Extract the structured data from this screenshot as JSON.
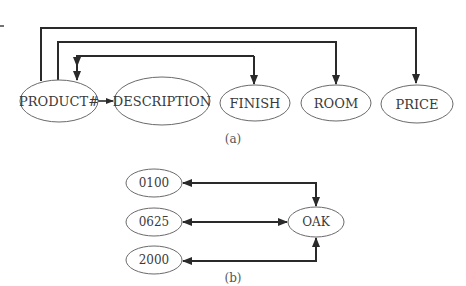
{
  "figure_a": {
    "caption": "(a)",
    "nodes": [
      {
        "id": "product",
        "label": "PRODUCT#"
      },
      {
        "id": "description",
        "label": "DESCRIPTION"
      },
      {
        "id": "finish",
        "label": "FINISH"
      },
      {
        "id": "room",
        "label": "ROOM"
      },
      {
        "id": "price",
        "label": "PRICE"
      }
    ],
    "edges": [
      {
        "from": "PRODUCT#",
        "to": "DESCRIPTION"
      },
      {
        "from": "PRODUCT#",
        "to": "FINISH"
      },
      {
        "from": "PRODUCT#",
        "to": "ROOM"
      },
      {
        "from": "PRODUCT#",
        "to": "PRICE"
      }
    ]
  },
  "figure_b": {
    "caption": "(b)",
    "nodes": [
      {
        "id": "v0100",
        "label": "0100"
      },
      {
        "id": "v0625",
        "label": "0625"
      },
      {
        "id": "v2000",
        "label": "2000"
      },
      {
        "id": "oak",
        "label": "OAK"
      }
    ],
    "edges": [
      {
        "between": [
          "0100",
          "OAK"
        ],
        "type": "bidirectional"
      },
      {
        "between": [
          "0625",
          "OAK"
        ],
        "type": "bidirectional"
      },
      {
        "between": [
          "2000",
          "OAK"
        ],
        "type": "bidirectional"
      }
    ]
  }
}
